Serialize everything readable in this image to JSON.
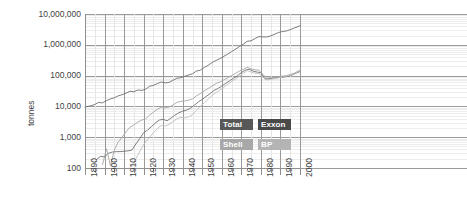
{
  "chart_data": {
    "type": "line",
    "title": "",
    "xlabel": "",
    "ylabel": "tonnes",
    "yscale": "log",
    "ylim": [
      100,
      10000000
    ],
    "xlim": [
      1890,
      2000
    ],
    "grid": true,
    "legend_position": "inside-lower-right",
    "y_tick_labels": [
      "10,000,000",
      "1,000,000",
      "100,000",
      "10,000",
      "1,000",
      "100"
    ],
    "y_tick_values": [
      10000000,
      1000000,
      100000,
      10000,
      1000,
      100
    ],
    "x_tick_labels": [
      "1890",
      "1900",
      "1910",
      "1920",
      "1930",
      "1940",
      "1950",
      "1960",
      "1970",
      "1980",
      "1990",
      "2000"
    ],
    "x_tick_values": [
      1890,
      1900,
      1910,
      1920,
      1930,
      1940,
      1950,
      1960,
      1970,
      1980,
      1990,
      2000
    ],
    "series": [
      {
        "name": "Total",
        "color": "#6e6e6e",
        "points": [
          [
            1890,
            9500
          ],
          [
            1893,
            10500
          ],
          [
            1895,
            11500
          ],
          [
            1897,
            13500
          ],
          [
            1899,
            13000
          ],
          [
            1901,
            15500
          ],
          [
            1903,
            17500
          ],
          [
            1905,
            19000
          ],
          [
            1907,
            22000
          ],
          [
            1909,
            24000
          ],
          [
            1911,
            27000
          ],
          [
            1913,
            31000
          ],
          [
            1915,
            30000
          ],
          [
            1917,
            34000
          ],
          [
            1919,
            33000
          ],
          [
            1921,
            36000
          ],
          [
            1923,
            45000
          ],
          [
            1925,
            48000
          ],
          [
            1927,
            55000
          ],
          [
            1929,
            62000
          ],
          [
            1931,
            58000
          ],
          [
            1933,
            60000
          ],
          [
            1935,
            70000
          ],
          [
            1937,
            82000
          ],
          [
            1939,
            85000
          ],
          [
            1941,
            95000
          ],
          [
            1943,
            105000
          ],
          [
            1945,
            115000
          ],
          [
            1947,
            140000
          ],
          [
            1949,
            150000
          ],
          [
            1951,
            185000
          ],
          [
            1953,
            215000
          ],
          [
            1955,
            265000
          ],
          [
            1957,
            310000
          ],
          [
            1959,
            355000
          ],
          [
            1961,
            420000
          ],
          [
            1963,
            500000
          ],
          [
            1965,
            600000
          ],
          [
            1967,
            720000
          ],
          [
            1969,
            880000
          ],
          [
            1971,
            1050000
          ],
          [
            1973,
            1300000
          ],
          [
            1975,
            1350000
          ],
          [
            1977,
            1600000
          ],
          [
            1979,
            1850000
          ],
          [
            1981,
            1800000
          ],
          [
            1983,
            1800000
          ],
          [
            1985,
            1950000
          ],
          [
            1987,
            2200000
          ],
          [
            1989,
            2500000
          ],
          [
            1991,
            2700000
          ],
          [
            1993,
            2800000
          ],
          [
            1995,
            3100000
          ],
          [
            1997,
            3500000
          ],
          [
            1999,
            3900000
          ],
          [
            2000,
            4200000
          ]
        ]
      },
      {
        "name": "Exxon",
        "color": "#707070",
        "points": [
          [
            1896,
            190
          ],
          [
            1898,
            240
          ],
          [
            1900,
            230
          ],
          [
            1902,
            300
          ],
          [
            1904,
            330
          ],
          [
            1906,
            340
          ],
          [
            1908,
            340
          ],
          [
            1910,
            350
          ],
          [
            1912,
            360
          ],
          [
            1914,
            380
          ],
          [
            1916,
            600
          ],
          [
            1918,
            900
          ],
          [
            1920,
            1400
          ],
          [
            1922,
            1700
          ],
          [
            1924,
            2200
          ],
          [
            1926,
            2900
          ],
          [
            1928,
            3600
          ],
          [
            1930,
            3800
          ],
          [
            1932,
            3400
          ],
          [
            1934,
            4200
          ],
          [
            1936,
            5200
          ],
          [
            1938,
            6200
          ],
          [
            1940,
            7000
          ],
          [
            1942,
            7600
          ],
          [
            1944,
            8800
          ],
          [
            1946,
            11000
          ],
          [
            1948,
            14000
          ],
          [
            1950,
            17000
          ],
          [
            1952,
            21000
          ],
          [
            1954,
            26000
          ],
          [
            1956,
            33000
          ],
          [
            1958,
            38000
          ],
          [
            1960,
            46000
          ],
          [
            1962,
            56000
          ],
          [
            1964,
            68000
          ],
          [
            1966,
            82000
          ],
          [
            1968,
            100000
          ],
          [
            1970,
            125000
          ],
          [
            1972,
            150000
          ],
          [
            1974,
            160000
          ],
          [
            1976,
            140000
          ],
          [
            1978,
            130000
          ],
          [
            1980,
            125000
          ],
          [
            1982,
            78000
          ],
          [
            1984,
            80000
          ],
          [
            1986,
            82000
          ],
          [
            1988,
            86000
          ],
          [
            1990,
            88000
          ],
          [
            1992,
            90000
          ],
          [
            1994,
            95000
          ],
          [
            1996,
            105000
          ],
          [
            1998,
            120000
          ],
          [
            2000,
            135000
          ]
        ]
      },
      {
        "name": "Shell",
        "color": "#a5a5a5",
        "points": [
          [
            1899,
            130
          ],
          [
            1901,
            420
          ],
          [
            1903,
            120
          ],
          [
            1905,
            380
          ],
          [
            1907,
            700
          ],
          [
            1909,
            1000
          ],
          [
            1911,
            1500
          ],
          [
            1913,
            2100
          ],
          [
            1915,
            2500
          ],
          [
            1917,
            3100
          ],
          [
            1919,
            3600
          ],
          [
            1921,
            3900
          ],
          [
            1923,
            5200
          ],
          [
            1925,
            6500
          ],
          [
            1927,
            8000
          ],
          [
            1929,
            9500
          ],
          [
            1931,
            9000
          ],
          [
            1933,
            9500
          ],
          [
            1935,
            11000
          ],
          [
            1937,
            13500
          ],
          [
            1939,
            14500
          ],
          [
            1941,
            15000
          ],
          [
            1943,
            16000
          ],
          [
            1945,
            17500
          ],
          [
            1947,
            22000
          ],
          [
            1949,
            26000
          ],
          [
            1951,
            32000
          ],
          [
            1953,
            38000
          ],
          [
            1955,
            46000
          ],
          [
            1957,
            55000
          ],
          [
            1959,
            62000
          ],
          [
            1961,
            72000
          ],
          [
            1963,
            85000
          ],
          [
            1965,
            100000
          ],
          [
            1967,
            118000
          ],
          [
            1969,
            140000
          ],
          [
            1971,
            160000
          ],
          [
            1973,
            185000
          ],
          [
            1975,
            165000
          ],
          [
            1977,
            155000
          ],
          [
            1979,
            150000
          ],
          [
            1981,
            110000
          ],
          [
            1983,
            82000
          ],
          [
            1985,
            85000
          ],
          [
            1987,
            88000
          ],
          [
            1989,
            92000
          ],
          [
            1991,
            96000
          ],
          [
            1993,
            100000
          ],
          [
            1995,
            108000
          ],
          [
            1997,
            120000
          ],
          [
            1999,
            140000
          ],
          [
            2000,
            150000
          ]
        ]
      },
      {
        "name": "BP",
        "color": "#bdbdbd",
        "points": [
          [
            1913,
            105
          ],
          [
            1915,
            150
          ],
          [
            1917,
            260
          ],
          [
            1919,
            450
          ],
          [
            1921,
            700
          ],
          [
            1923,
            1000
          ],
          [
            1925,
            1400
          ],
          [
            1927,
            1900
          ],
          [
            1929,
            2400
          ],
          [
            1931,
            2300
          ],
          [
            1933,
            2600
          ],
          [
            1935,
            3200
          ],
          [
            1937,
            4000
          ],
          [
            1939,
            4400
          ],
          [
            1941,
            4200
          ],
          [
            1943,
            4600
          ],
          [
            1945,
            5400
          ],
          [
            1947,
            7500
          ],
          [
            1949,
            10000
          ],
          [
            1951,
            13000
          ],
          [
            1953,
            17000
          ],
          [
            1955,
            23000
          ],
          [
            1957,
            28000
          ],
          [
            1959,
            34000
          ],
          [
            1961,
            42000
          ],
          [
            1963,
            52000
          ],
          [
            1965,
            64000
          ],
          [
            1967,
            78000
          ],
          [
            1969,
            96000
          ],
          [
            1971,
            118000
          ],
          [
            1973,
            145000
          ],
          [
            1975,
            130000
          ],
          [
            1977,
            120000
          ],
          [
            1979,
            118000
          ],
          [
            1981,
            90000
          ],
          [
            1983,
            72000
          ],
          [
            1985,
            76000
          ],
          [
            1987,
            80000
          ],
          [
            1989,
            85000
          ],
          [
            1991,
            90000
          ],
          [
            1993,
            95000
          ],
          [
            1995,
            102000
          ],
          [
            1997,
            115000
          ],
          [
            1999,
            132000
          ],
          [
            2000,
            142000
          ]
        ]
      }
    ]
  },
  "legend": {
    "items": [
      {
        "label": "Total",
        "key": "total"
      },
      {
        "label": "Exxon",
        "key": "exxon"
      },
      {
        "label": "Shell",
        "key": "shell"
      },
      {
        "label": "BP",
        "key": "bp"
      }
    ]
  }
}
